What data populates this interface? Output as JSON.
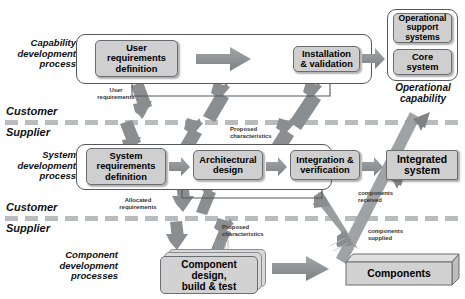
{
  "diagram": {
    "colors": {
      "node_fill": "#cfcfcf",
      "node_border": "#6a6e71",
      "process_border": "#55595c",
      "arrow_fill": "#8b8f92",
      "dashed_line": "#b9bcbe",
      "background": "#ffffff"
    },
    "lanes": [
      {
        "name": "capability-development-process",
        "label": "Capability\ndevelopment\nprocess"
      },
      {
        "name": "system-development-process",
        "label": "System\ndevelopment\nprocess"
      },
      {
        "name": "component-development-processes",
        "label": "Component\ndevelopment\nprocesses"
      }
    ],
    "boundaries": [
      {
        "name": "boundary-upper",
        "above": "Customer",
        "below": "Supplier"
      },
      {
        "name": "boundary-lower",
        "above": "Customer",
        "below": "Supplier"
      }
    ],
    "nodes": [
      {
        "id": "user-requirements-definition",
        "label": "User\nrequirements\ndefinition"
      },
      {
        "id": "installation-validation",
        "label": "Installation\n& validation"
      },
      {
        "id": "operational-support-systems",
        "label": "Operational\nsupport\nsystems"
      },
      {
        "id": "core-system",
        "label": "Core\nsystem"
      },
      {
        "id": "system-requirements-definition",
        "label": "System\nrequirements\ndefinition"
      },
      {
        "id": "architectural-design",
        "label": "Architectural\ndesign"
      },
      {
        "id": "integration-verification",
        "label": "Integration &\nverification"
      },
      {
        "id": "integrated-system",
        "label": "Integrated\nsystem"
      },
      {
        "id": "component-design-build-test",
        "label": "Component\ndesign,\nbuild & test"
      },
      {
        "id": "components",
        "label": "Components"
      }
    ],
    "group_captions": [
      {
        "id": "operational-capability",
        "label": "Operational\ncapability"
      }
    ],
    "flow_labels": [
      {
        "id": "user-requirements",
        "label": "User\nrequirements"
      },
      {
        "id": "proposed-characteristics-upper",
        "label": "Proposed\ncharacteristics"
      },
      {
        "id": "allocated-requirements",
        "label": "Allocated\nrequirements"
      },
      {
        "id": "proposed-characteristics-lower",
        "label": "Proposed\ncharacteristics"
      },
      {
        "id": "components-received",
        "label": "components\nreceived"
      },
      {
        "id": "components-supplied",
        "label": "components\nsupplied"
      }
    ]
  }
}
